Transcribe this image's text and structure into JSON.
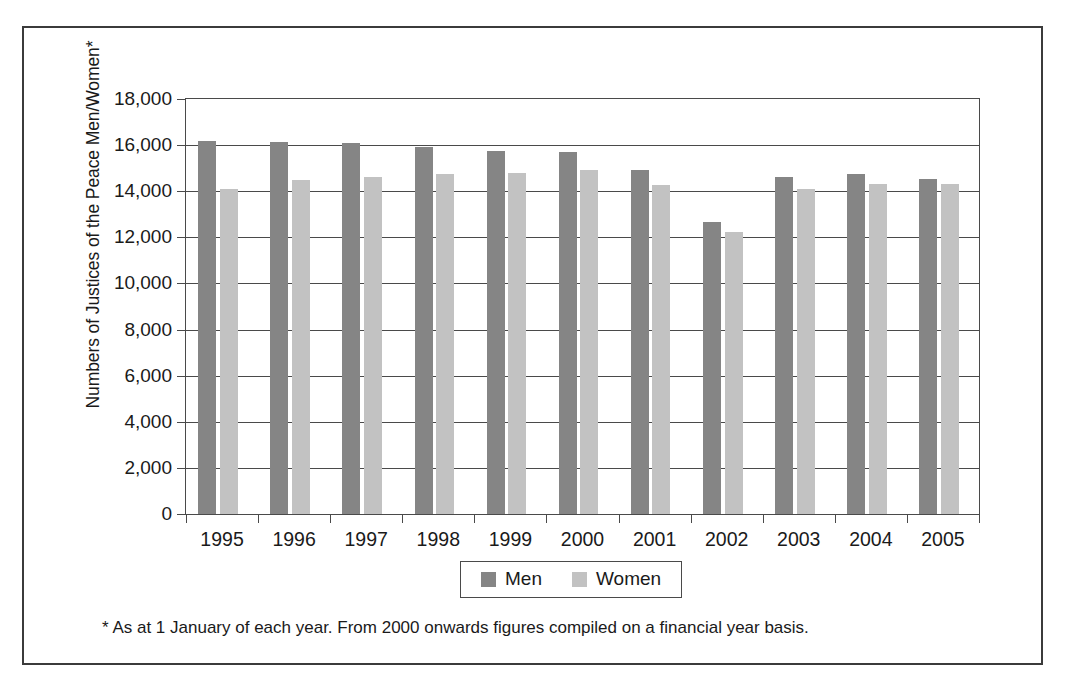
{
  "chart_data": {
    "type": "bar",
    "title": "",
    "subtitle": "",
    "xlabel": "",
    "ylabel": "Numbers of Justices of the Peace Men/Women*",
    "categories": [
      "1995",
      "1996",
      "1997",
      "1998",
      "1999",
      "2000",
      "2001",
      "2002",
      "2003",
      "2004",
      "2005"
    ],
    "series": [
      {
        "name": "Men",
        "color": "#858585",
        "values": [
          16200,
          16150,
          16100,
          15900,
          15750,
          15700,
          14900,
          12650,
          14600,
          14750,
          14550
        ]
      },
      {
        "name": "Women",
        "color": "#c2c2c2",
        "values": [
          14100,
          14500,
          14600,
          14750,
          14800,
          14900,
          14250,
          12250,
          14100,
          14300,
          14300
        ]
      }
    ],
    "ylim": [
      0,
      18000
    ],
    "ytick_step": 2000,
    "ytick_labels": [
      "0",
      "2,000",
      "4,000",
      "6,000",
      "8,000",
      "10,000",
      "12,000",
      "14,000",
      "16,000",
      "18,000"
    ],
    "grid": "horizontal",
    "legend_position": "bottom-center",
    "footnote": "* As at 1 January of each year. From 2000 onwards figures compiled on a financial year basis."
  }
}
